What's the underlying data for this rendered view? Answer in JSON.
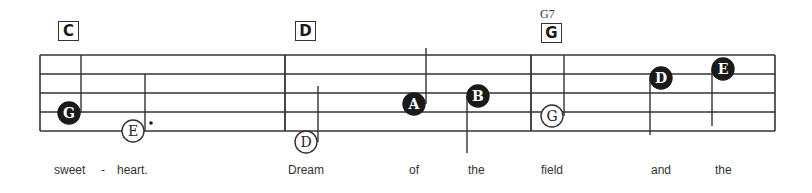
{
  "staff": {
    "left": 40,
    "right": 775,
    "lines_y": [
      55,
      74,
      93,
      112,
      131
    ],
    "barlines_x": [
      285,
      531
    ],
    "color": "#333333"
  },
  "chords": [
    {
      "label": "C",
      "x": 58,
      "y": 21
    },
    {
      "label": "D",
      "x": 295,
      "y": 21
    },
    {
      "label": "G",
      "x": 541,
      "y": 23,
      "alt": "G7"
    }
  ],
  "notes": [
    {
      "letter": "G",
      "cx": 69,
      "cy": 113,
      "filled": true,
      "stem": "up",
      "stem_x": 81,
      "stem_y1": 113,
      "stem_y2": 55
    },
    {
      "letter": "E",
      "cx": 133,
      "cy": 131,
      "filled": false,
      "stem": "up",
      "stem_x": 145,
      "stem_y1": 131,
      "stem_y2": 74,
      "dotted": true
    },
    {
      "letter": "D",
      "cx": 306,
      "cy": 142,
      "filled": false,
      "stem": "up",
      "stem_x": 318,
      "stem_y1": 142,
      "stem_y2": 86
    },
    {
      "letter": "A",
      "cx": 414,
      "cy": 104,
      "filled": true,
      "stem": "up",
      "stem_x": 426,
      "stem_y1": 104,
      "stem_y2": 48
    },
    {
      "letter": "B",
      "cx": 478,
      "cy": 96,
      "filled": true,
      "stem": "down",
      "stem_x": 467,
      "stem_y1": 96,
      "stem_y2": 153
    },
    {
      "letter": "G",
      "cx": 552,
      "cy": 116,
      "filled": false,
      "stem": "up",
      "stem_x": 564,
      "stem_y1": 116,
      "stem_y2": 55
    },
    {
      "letter": "D",
      "cx": 661,
      "cy": 78,
      "filled": true,
      "stem": "down",
      "stem_x": 650,
      "stem_y1": 78,
      "stem_y2": 135
    },
    {
      "letter": "E",
      "cx": 723,
      "cy": 69,
      "filled": true,
      "stem": "down",
      "stem_x": 712,
      "stem_y1": 69,
      "stem_y2": 126
    }
  ],
  "lyrics": [
    {
      "text": "sweet",
      "x": 54
    },
    {
      "text": "-",
      "x": 101
    },
    {
      "text": "heart.",
      "x": 117
    },
    {
      "text": "Dream",
      "x": 288
    },
    {
      "text": "of",
      "x": 409
    },
    {
      "text": "the",
      "x": 468
    },
    {
      "text": "field",
      "x": 541
    },
    {
      "text": "and",
      "x": 651
    },
    {
      "text": "the",
      "x": 715
    }
  ]
}
